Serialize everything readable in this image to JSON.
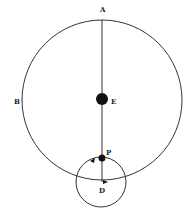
{
  "diagram": {
    "labels": {
      "A": "A",
      "B": "B",
      "E": "E",
      "P": "P",
      "D": "D"
    },
    "colors": {
      "line": "#333333",
      "dot": "#111111",
      "background": "#ffffff"
    }
  }
}
